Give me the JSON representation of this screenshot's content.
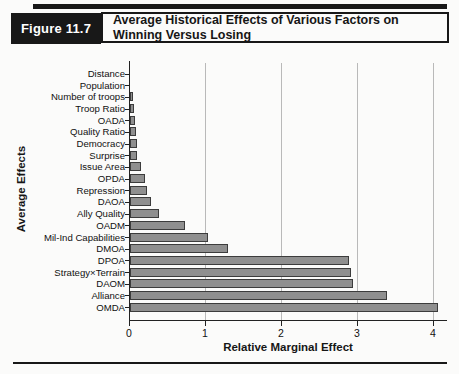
{
  "figure": {
    "label": "Figure 11.7",
    "title_line1": "Average Historical Effects of Various Factors on",
    "title_line2": "Winning Versus Losing"
  },
  "chart_data": {
    "type": "bar",
    "orientation": "horizontal",
    "xlabel": "Relative Marginal Effect",
    "ylabel": "Average Effects",
    "xlim": [
      0,
      4.2
    ],
    "xticks": [
      0,
      1,
      2,
      3,
      4
    ],
    "grid": "vertical gridlines at each integer tick",
    "legend": "none",
    "categories": [
      "Distance",
      "Population",
      "Number of troops",
      "Troop Ratio",
      "OADA",
      "Quality Ratio",
      "Democracy",
      "Surprise",
      "Issue Area",
      "OPDA",
      "Repression",
      "DAOA",
      "Ally Quality",
      "OADM",
      "Mil-Ind Capabilities",
      "DMOA",
      "DPOA",
      "Strategy×Terrain",
      "DAOM",
      "Alliance",
      "OMDA"
    ],
    "values": [
      0,
      0,
      0.01,
      0.02,
      0.04,
      0.05,
      0.06,
      0.07,
      0.12,
      0.17,
      0.2,
      0.25,
      0.35,
      0.7,
      1.0,
      1.26,
      2.85,
      2.88,
      2.91,
      3.35,
      4.02
    ],
    "bar_color": "#8f8f8f",
    "bar_border_color": "#3c3c3c",
    "gridline_color": "#b9b9b9",
    "axis_color": "#222222"
  }
}
